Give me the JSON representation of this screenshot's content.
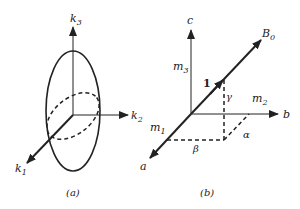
{
  "figure": {
    "panel_a": {
      "caption": "(a)",
      "axes": {
        "k1": "k",
        "k1_sub": "1",
        "k2": "k",
        "k2_sub": "2",
        "k3": "k",
        "k3_sub": "3"
      }
    },
    "panel_b": {
      "caption": "(b)",
      "axes": {
        "a": "a",
        "b": "b",
        "c": "c"
      },
      "vector": {
        "name": "B",
        "sub": "0",
        "unit_label": "1"
      },
      "components": {
        "m1": "m",
        "m1_sub": "1",
        "m2": "m",
        "m2_sub": "2",
        "m3": "m",
        "m3_sub": "3"
      },
      "angles": {
        "alpha": "α",
        "beta": "β",
        "gamma": "γ"
      }
    }
  },
  "colors": {
    "ink": "#222222",
    "background": "#ffffff"
  }
}
